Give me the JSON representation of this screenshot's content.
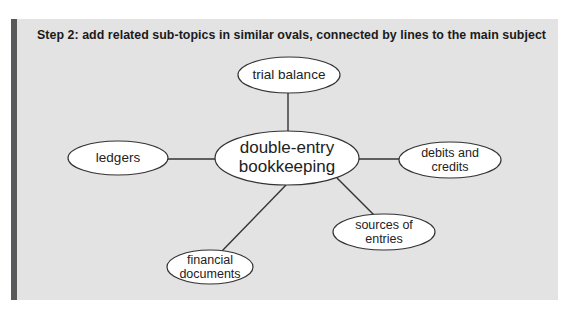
{
  "heading": "Step 2: add related sub-topics in similar ovals, connected by lines to the main subject",
  "colors": {
    "panel_bg": "#e3e3e3",
    "accent_bar": "#58595b",
    "oval_fill": "#ffffff",
    "oval_stroke": "#333333",
    "line": "#333333"
  },
  "main_subject": {
    "line1": "double-entry",
    "line2": "bookkeeping"
  },
  "subtopics": {
    "trial_balance": {
      "line1": "trial balance"
    },
    "ledgers": {
      "line1": "ledgers"
    },
    "debits_credits": {
      "line1": "debits and",
      "line2": "credits"
    },
    "sources_entries": {
      "line1": "sources of",
      "line2": "entries"
    },
    "financial_documents": {
      "line1": "financial",
      "line2": "documents"
    }
  }
}
